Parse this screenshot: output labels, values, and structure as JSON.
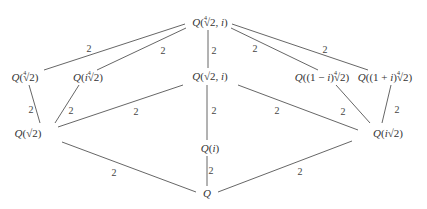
{
  "diagram": {
    "type": "field-extension-lattice",
    "line_color": "#555555",
    "nodes": [
      {
        "id": "top",
        "label": "Q(⁴√2, i)",
        "x": 210,
        "y": 21
      },
      {
        "id": "q4r2",
        "label": "Q(⁴√2)",
        "x": 25,
        "y": 76
      },
      {
        "id": "qi4r2",
        "label": "Q(i⁴√2)",
        "x": 88,
        "y": 76
      },
      {
        "id": "qr2i",
        "label": "Q(√2, i)",
        "x": 210,
        "y": 76
      },
      {
        "id": "q1mi",
        "label": "Q((1 − i)⁴√2)",
        "x": 322,
        "y": 76
      },
      {
        "id": "q1pi",
        "label": "Q((1 + i)⁴√2)",
        "x": 385,
        "y": 76
      },
      {
        "id": "qr2",
        "label": "Q(√2)",
        "x": 28,
        "y": 133
      },
      {
        "id": "qi",
        "label": "Q(i)",
        "x": 210,
        "y": 148
      },
      {
        "id": "qir2",
        "label": "Q(i√2)",
        "x": 388,
        "y": 133
      },
      {
        "id": "base",
        "label": "Q",
        "x": 207,
        "y": 193
      }
    ],
    "edges": [
      {
        "from": "top",
        "to": "q4r2",
        "label": "2",
        "x1": 185,
        "y1": 24,
        "x2": 44,
        "y2": 70,
        "lx": 89,
        "ly": 48
      },
      {
        "from": "top",
        "to": "qi4r2",
        "label": "2",
        "x1": 186,
        "y1": 28,
        "x2": 97,
        "y2": 70,
        "lx": 163,
        "ly": 50
      },
      {
        "from": "top",
        "to": "qr2i",
        "label": "2",
        "x1": 208,
        "y1": 30,
        "x2": 208,
        "y2": 68,
        "lx": 214,
        "ly": 50
      },
      {
        "from": "top",
        "to": "q1mi",
        "label": "2",
        "x1": 231,
        "y1": 28,
        "x2": 318,
        "y2": 70,
        "lx": 255,
        "ly": 48
      },
      {
        "from": "top",
        "to": "q1pi",
        "label": "2",
        "x1": 232,
        "y1": 24,
        "x2": 368,
        "y2": 70,
        "lx": 325,
        "ly": 49
      },
      {
        "from": "q4r2",
        "to": "qr2",
        "label": "2",
        "x1": 29,
        "y1": 85,
        "x2": 40,
        "y2": 123,
        "lx": 31,
        "ly": 109
      },
      {
        "from": "qi4r2",
        "to": "qr2",
        "label": "2",
        "x1": 79,
        "y1": 85,
        "x2": 55,
        "y2": 123,
        "lx": 71,
        "ly": 110
      },
      {
        "from": "qr2i",
        "to": "qr2",
        "label": "2",
        "x1": 183,
        "y1": 85,
        "x2": 58,
        "y2": 127,
        "lx": 136,
        "ly": 111
      },
      {
        "from": "qr2i",
        "to": "qi",
        "label": "2",
        "x1": 207,
        "y1": 85,
        "x2": 207,
        "y2": 140,
        "lx": 214,
        "ly": 110
      },
      {
        "from": "qr2i",
        "to": "qir2",
        "label": "2",
        "x1": 238,
        "y1": 85,
        "x2": 358,
        "y2": 130,
        "lx": 277,
        "ly": 110
      },
      {
        "from": "q1mi",
        "to": "qir2",
        "label": "2",
        "x1": 336,
        "y1": 85,
        "x2": 370,
        "y2": 123,
        "lx": 343,
        "ly": 111
      },
      {
        "from": "q1pi",
        "to": "qir2",
        "label": "2",
        "x1": 391,
        "y1": 85,
        "x2": 382,
        "y2": 123,
        "lx": 397,
        "ly": 109
      },
      {
        "from": "qr2",
        "to": "base",
        "label": "2",
        "x1": 62,
        "y1": 142,
        "x2": 196,
        "y2": 192,
        "lx": 114,
        "ly": 172
      },
      {
        "from": "qi",
        "to": "base",
        "label": "2",
        "x1": 207,
        "y1": 156,
        "x2": 207,
        "y2": 186,
        "lx": 211,
        "ly": 170
      },
      {
        "from": "qir2",
        "to": "base",
        "label": "2",
        "x1": 352,
        "y1": 141,
        "x2": 218,
        "y2": 192,
        "lx": 300,
        "ly": 171
      }
    ]
  }
}
